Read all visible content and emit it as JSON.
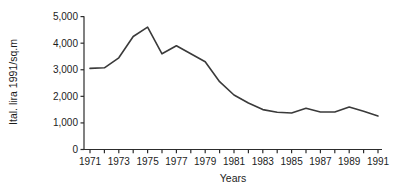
{
  "chart_data": {
    "type": "line",
    "title": "",
    "xlabel": "Years",
    "ylabel": "Ital. lira 1991/sq.m",
    "x": [
      1971,
      1972,
      1973,
      1974,
      1975,
      1976,
      1977,
      1978,
      1979,
      1980,
      1981,
      1982,
      1983,
      1984,
      1985,
      1986,
      1987,
      1988,
      1989,
      1990,
      1991
    ],
    "values": [
      3050,
      3075,
      3450,
      4250,
      4600,
      3600,
      3900,
      3600,
      3300,
      2550,
      2050,
      1750,
      1500,
      1400,
      1375,
      1550,
      1410,
      1410,
      1600,
      1440,
      1260
    ],
    "ylim": [
      0,
      5000
    ],
    "yticks": [
      0,
      1000,
      2000,
      3000,
      4000,
      5000
    ],
    "ytick_labels": [
      "0",
      "1,000",
      "2,000",
      "3,000",
      "4,000",
      "5,000"
    ],
    "xtick_labels": [
      "1971",
      "1973",
      "1975",
      "1977",
      "1979",
      "1981",
      "1983",
      "1985",
      "1987",
      "1989",
      "1991"
    ],
    "x_tick_step_years": 1,
    "x_label_step_years": 2,
    "grid": false,
    "legend_position": "none",
    "line_color": "#3a3a3a",
    "axis_color": "#2c2c2c"
  }
}
